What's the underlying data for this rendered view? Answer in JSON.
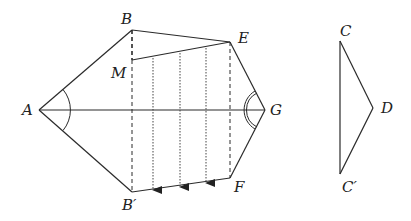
{
  "figure": {
    "type": "geometry-diagram",
    "colors": {
      "stroke": "#2a2a2a",
      "background": "#ffffff"
    },
    "points": {
      "A": {
        "label": "A",
        "x": 39,
        "y": 110
      },
      "B": {
        "label": "B",
        "x": 132,
        "y": 30
      },
      "M": {
        "label": "M",
        "x": 132,
        "y": 60
      },
      "E": {
        "label": "E",
        "x": 230,
        "y": 42
      },
      "G": {
        "label": "G",
        "x": 265,
        "y": 110
      },
      "F": {
        "label": "F",
        "x": 230,
        "y": 178
      },
      "B_prime": {
        "label": "B′",
        "x": 132,
        "y": 192
      },
      "C": {
        "label": "C",
        "x": 340,
        "y": 41
      },
      "D": {
        "label": "D",
        "x": 373,
        "y": 108
      },
      "C_prime": {
        "label": "C′",
        "x": 340,
        "y": 174
      }
    },
    "labels": {
      "A": "A",
      "B": "B",
      "M": "M",
      "E": "E",
      "G": "G",
      "F": "F",
      "B_prime": "B′",
      "C": "C",
      "D": "D",
      "C_prime": "C′"
    },
    "solid_segments": [
      "AB",
      "BE",
      "EG",
      "GF",
      "FB′",
      "B′A",
      "ME",
      "AG",
      "CD",
      "DC′",
      "CC′"
    ],
    "dashed_segments": [
      "BB′",
      "EF",
      "BM"
    ],
    "dotted_arrows": [
      {
        "x": 153,
        "from_y": 58,
        "to_y": 190
      },
      {
        "x": 180,
        "from_y": 53,
        "to_y": 187
      },
      {
        "x": 206,
        "from_y": 48,
        "to_y": 183
      }
    ],
    "angle_marks": [
      {
        "vertex": "A",
        "style": "single-arc"
      },
      {
        "vertex": "G",
        "style": "double-arc"
      }
    ]
  }
}
